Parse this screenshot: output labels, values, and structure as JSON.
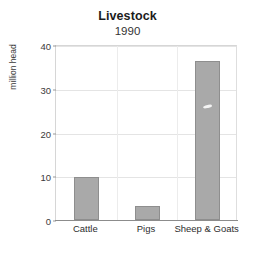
{
  "chart_data": {
    "type": "bar",
    "title": "Livestock",
    "subtitle": "1990",
    "xlabel": "",
    "ylabel": "million head",
    "categories": [
      "Cattle",
      "Pigs",
      "Sheep & Goats"
    ],
    "values": [
      9.8,
      3.2,
      36.3
    ],
    "ylim": [
      0,
      40
    ],
    "yticks": [
      0,
      10,
      20,
      30,
      40
    ],
    "ytick_labels": [
      "0",
      "10",
      "20",
      "30",
      "40"
    ],
    "grid": true,
    "legend": "none",
    "bar_color": "#a9a9a9",
    "bar_edge_color": "#8e8e8e",
    "background_color": "#ffffff",
    "grid_color": "#e4e4e4",
    "axis_color": "#8c8c8c"
  }
}
